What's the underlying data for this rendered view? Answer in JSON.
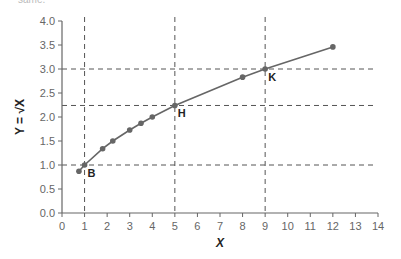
{
  "header": {
    "clipped_text": "same."
  },
  "chart_data": {
    "type": "line",
    "title": "",
    "xlabel": "X",
    "ylabel": "Y = √X",
    "xlim": [
      0,
      14
    ],
    "ylim": [
      0,
      4.0
    ],
    "x_ticks": [
      "0",
      "1",
      "2",
      "3",
      "4",
      "5",
      "6",
      "7",
      "8",
      "9",
      "10",
      "11",
      "12",
      "13",
      "14"
    ],
    "y_ticks": [
      "0.0",
      "0.5",
      "1.0",
      "1.5",
      "2.0",
      "2.5",
      "3.0",
      "3.5",
      "4.0"
    ],
    "grid": false,
    "series": [
      {
        "name": "Y = sqrt(X)",
        "x": [
          0.75,
          1,
          1.8,
          2.25,
          3,
          3.5,
          4,
          5,
          8,
          9,
          12
        ],
        "y": [
          0.87,
          1.0,
          1.34,
          1.5,
          1.73,
          1.87,
          2.0,
          2.24,
          2.83,
          3.0,
          3.46
        ]
      }
    ],
    "reference_lines": {
      "vertical": [
        1,
        5,
        9
      ],
      "horizontal": [
        1.0,
        2.24,
        3.0
      ]
    },
    "annotations": [
      {
        "label": "B",
        "x": 1,
        "y": 1.0
      },
      {
        "label": "H",
        "x": 5,
        "y": 2.24
      },
      {
        "label": "K",
        "x": 9,
        "y": 3.0
      }
    ],
    "colors": {
      "line": "#666666",
      "marker": "#666666",
      "axis": "#666666",
      "dash": "#555555"
    }
  }
}
